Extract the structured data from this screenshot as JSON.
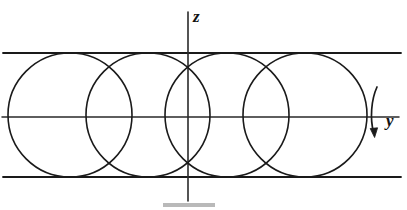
{
  "figure": {
    "title": "",
    "background_color": "#ffffff",
    "stroke_color": "#1a1a1a",
    "labels": {
      "z_axis": "z",
      "y_axis": "y"
    },
    "icon_names": {
      "rotation_arrow": "curved-rotation-arrow-icon",
      "vertical_axis": "z-axis-line",
      "horizontal_axis": "y-axis-line"
    }
  },
  "chart_data": {
    "type": "scatter",
    "title": "",
    "subtitle": "",
    "xlabel": "y",
    "ylabel": "z",
    "grid": false,
    "legend": null,
    "axes": {
      "vertical_axis": {
        "label": "z",
        "x": 188,
        "y_start": 12,
        "y_end": 201
      },
      "horizontal_axis": {
        "label": "y",
        "y": 117,
        "x_start": 2,
        "x_end": 399
      }
    },
    "guide_lines": [
      {
        "name": "upper-guide-line",
        "y": 53,
        "x_start": 3,
        "x_end": 401
      },
      {
        "name": "lower-guide-line",
        "y": 177,
        "x_start": 3,
        "x_end": 401
      }
    ],
    "circles": [
      {
        "name": "circle-1",
        "cx": 70,
        "cy": 115,
        "r": 62
      },
      {
        "name": "circle-2",
        "cx": 148,
        "cy": 115,
        "r": 62
      },
      {
        "name": "circle-3",
        "cx": 227,
        "cy": 115,
        "r": 62
      },
      {
        "name": "circle-4",
        "cx": 305,
        "cy": 115,
        "r": 62
      }
    ],
    "rotation_arrow": {
      "name": "rotation-arrow",
      "path": "M 377 88 C 372 100, 371 118, 374 134",
      "arrowhead_at": [
        374,
        136
      ],
      "direction": "clockwise-downward"
    },
    "xlim": [
      0,
      407
    ],
    "ylim": [
      0,
      210
    ]
  }
}
